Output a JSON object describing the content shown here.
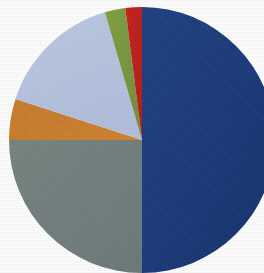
{
  "chart_data": {
    "type": "pie",
    "title": "",
    "subtitle": "",
    "xlabel": "",
    "ylabel": "",
    "legend_position": "none",
    "grid": false,
    "start_angle_deg": 0,
    "direction": "clockwise",
    "center": {
      "x": 142,
      "y": 140
    },
    "radius": 133,
    "categories": [
      "Segment 1",
      "Segment 2",
      "Segment 3",
      "Segment 4",
      "Segment 5",
      "Segment 6"
    ],
    "values": [
      50.0,
      25.0,
      5.0,
      15.5,
      2.5,
      2.0
    ],
    "labels": [],
    "annotations": [],
    "slices": [
      {
        "name": "Segment 1",
        "value": 50.0,
        "percent": "50.0%",
        "color": "#1b3a7a",
        "start_deg": 0,
        "end_deg": 180
      },
      {
        "name": "Segment 2",
        "value": 25.0,
        "percent": "25.0%",
        "color": "#71807e",
        "start_deg": 180,
        "end_deg": 270
      },
      {
        "name": "Segment 3",
        "value": 5.0,
        "percent": "5.0%",
        "color": "#cc7a28",
        "start_deg": 270,
        "end_deg": 288
      },
      {
        "name": "Segment 4",
        "value": 15.5,
        "percent": "15.5%",
        "color": "#b8c6e2",
        "start_deg": 288,
        "end_deg": 343.8
      },
      {
        "name": "Segment 5",
        "value": 2.5,
        "percent": "2.5%",
        "color": "#7a9c3f",
        "start_deg": 343.8,
        "end_deg": 352.8
      },
      {
        "name": "Segment 6",
        "value": 2.0,
        "percent": "2.0%",
        "color": "#c0201c",
        "start_deg": 352.8,
        "end_deg": 360
      }
    ],
    "background_color": "#ffffff"
  },
  "figure": {
    "alt_text": "Pie chart with six segments",
    "width": 264,
    "height": 273
  }
}
